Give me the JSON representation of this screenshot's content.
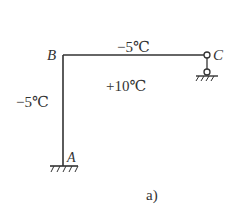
{
  "diagram": {
    "type": "frame-structure",
    "nodes": {
      "A": {
        "label": "A",
        "support": "fixed"
      },
      "B": {
        "label": "B",
        "support": "rigid-joint"
      },
      "C": {
        "label": "C",
        "support": "pin-link"
      }
    },
    "members": [
      {
        "from": "B",
        "to": "C",
        "orientation": "horizontal"
      },
      {
        "from": "A",
        "to": "B",
        "orientation": "vertical"
      }
    ],
    "temperatures": {
      "outside_top": "−5℃",
      "outside_left": "−5℃",
      "inside": "+10℃"
    },
    "caption": "a)"
  },
  "colors": {
    "line": "#333333",
    "background": "#ffffff"
  }
}
